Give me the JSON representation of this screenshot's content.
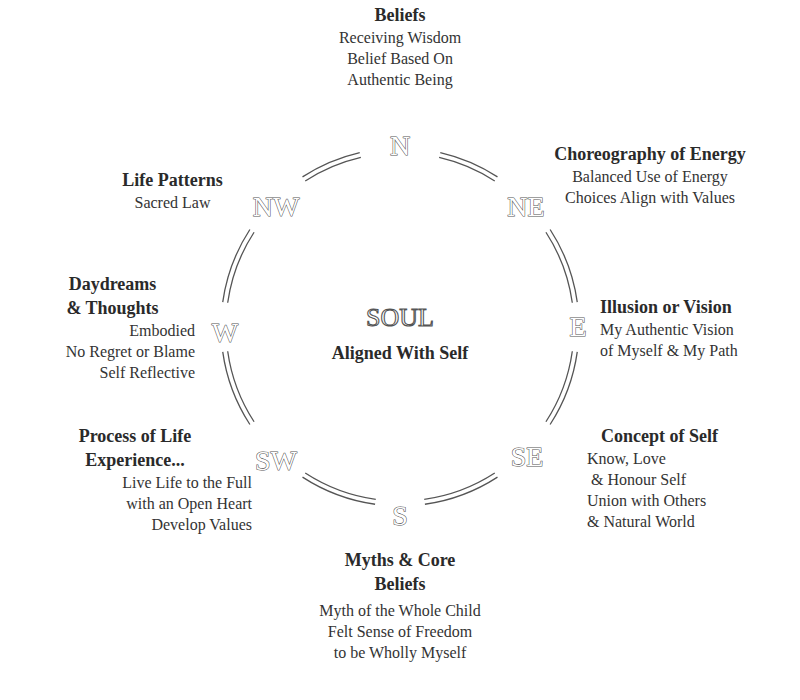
{
  "center": {
    "title": "SOUL",
    "subtitle": "Aligned With Self"
  },
  "compass": {
    "N": "N",
    "NE": "NE",
    "E": "E",
    "SE": "SE",
    "S": "S",
    "SW": "SW",
    "W": "W",
    "NW": "NW"
  },
  "directions": {
    "north": {
      "title": "Beliefs",
      "lines": [
        "Receiving Wisdom",
        "Belief Based On",
        "Authentic Being"
      ]
    },
    "northeast": {
      "title": "Choreography of Energy",
      "lines": [
        "Balanced Use of Energy",
        "Choices Align with Values"
      ]
    },
    "east": {
      "title": "Illusion or Vision",
      "lines": [
        "My Authentic Vision",
        "of Myself & My Path"
      ]
    },
    "southeast": {
      "title": "Concept of Self",
      "lines": [
        "Know, Love",
        " & Honour Self",
        "Union with Others",
        "& Natural World"
      ]
    },
    "south": {
      "title_lines": [
        "Myths & Core",
        "Beliefs"
      ],
      "lines": [
        "Myth of the Whole Child",
        "Felt Sense of Freedom",
        "to be Wholly Myself"
      ]
    },
    "southwest": {
      "title_lines": [
        "Process of Life",
        "Experience..."
      ],
      "lines": [
        "Live Life to the Full",
        "with an Open Heart",
        "Develop Values"
      ]
    },
    "west": {
      "title_lines": [
        "Daydreams",
        "& Thoughts"
      ],
      "lines": [
        "Embodied",
        "No Regret or Blame",
        "Self Reflective"
      ]
    },
    "northwest": {
      "title": "Life Patterns",
      "lines": [
        "Sacred Law"
      ]
    }
  },
  "colors": {
    "ring": "#555555",
    "text": "#2a2a2a",
    "background": "#ffffff"
  }
}
